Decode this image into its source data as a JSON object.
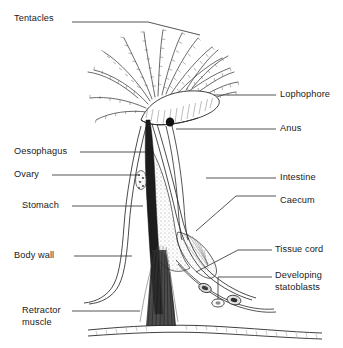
{
  "figure": {
    "type": "labelled-line-diagram",
    "width": 343,
    "height": 348,
    "background_color": "#ffffff",
    "ink_color": "#1a1a1a",
    "stipple_color": "#9a9a9a"
  },
  "labels": {
    "left": [
      {
        "id": "tentacles",
        "text": "Tentacles",
        "x": 14,
        "y": 18
      },
      {
        "id": "oesophagus",
        "text": "Oesophagus",
        "x": 14,
        "y": 148
      },
      {
        "id": "ovary",
        "text": "Ovary",
        "x": 14,
        "y": 171
      },
      {
        "id": "stomach",
        "text": "Stomach",
        "x": 22,
        "y": 202
      },
      {
        "id": "body-wall",
        "text": "Body wall",
        "x": 14,
        "y": 252
      },
      {
        "id": "retractor-muscle",
        "text": "Retractor\nmuscle",
        "x": 22,
        "y": 307
      }
    ],
    "right": [
      {
        "id": "lophophore",
        "text": "Lophophore",
        "x": 280,
        "y": 91
      },
      {
        "id": "anus",
        "text": "Anus",
        "x": 280,
        "y": 125
      },
      {
        "id": "intestine",
        "text": "Intestine",
        "x": 280,
        "y": 174
      },
      {
        "id": "caecum",
        "text": "Caecum",
        "x": 280,
        "y": 197
      },
      {
        "id": "tissue-cord",
        "text": "Tissue cord",
        "x": 275,
        "y": 246
      },
      {
        "id": "developing-statoblasts",
        "text": "Developing\nstatoblasts",
        "x": 275,
        "y": 272
      }
    ]
  },
  "parts": {
    "tentacles": "ciliated tentacle crown, about 16 curved fringed arms",
    "lophophore": "horseshoe-shaped tentacle-bearing ring at top of polypide",
    "anus": "small dark opening below lophophore outside tentacle ring",
    "oesophagus": "dark narrow tube descending from mouth",
    "ovary": "small stippled oval body on left of gut",
    "intestine": "tube running up the right side of the gut loop",
    "stomach": "broad stippled sac in mid body",
    "caecum": "blind pouch at base of stomach",
    "body_wall": "outer cystid sheath, paired thin outlines",
    "retractor_muscle": "fanned fibre bundle anchoring polypide to base",
    "tissue_cord": "funiculus running from caecum to body wall",
    "statoblasts": "two small oval resting bodies on the funiculus",
    "substrate": "wavy double line base at bottom of figure"
  }
}
